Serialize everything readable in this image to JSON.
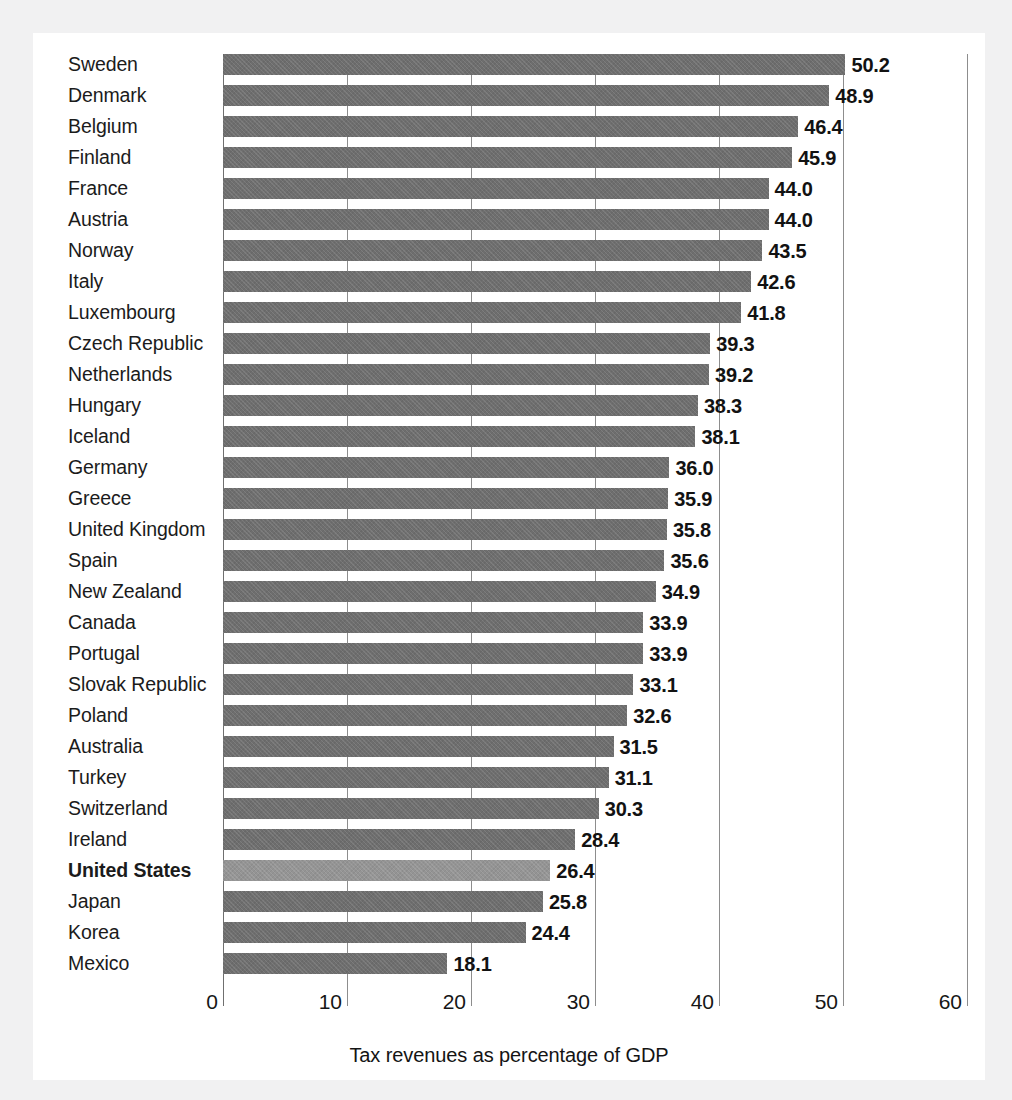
{
  "scan": {
    "top_partial_text": "",
    "page_background": "#f1f1f2",
    "panel_background": "#ffffff"
  },
  "colors": {
    "bar": "#6e6e6e",
    "bar_highlight": "#949494",
    "gridline": "#8d8d8d",
    "text": "#161616"
  },
  "chart_data": {
    "type": "bar",
    "orientation": "horizontal",
    "title": "",
    "xlabel": "Tax revenues as percentage of GDP",
    "ylabel": "",
    "xlim": [
      0,
      60
    ],
    "xticks": [
      0,
      10,
      20,
      30,
      40,
      50,
      60
    ],
    "xtick_labels": [
      "0",
      "10",
      "20",
      "30",
      "40",
      "50",
      "60"
    ],
    "grid": true,
    "grid_axis": "x",
    "legend": "none",
    "highlight_category": "United States",
    "value_labels": true,
    "value_label_format": "one-decimal",
    "categories": [
      "Sweden",
      "Denmark",
      "Belgium",
      "Finland",
      "France",
      "Austria",
      "Norway",
      "Italy",
      "Luxembourg",
      "Czech Republic",
      "Netherlands",
      "Hungary",
      "Iceland",
      "Germany",
      "Greece",
      "United Kingdom",
      "Spain",
      "New Zealand",
      "Canada",
      "Portugal",
      "Slovak Republic",
      "Poland",
      "Australia",
      "Turkey",
      "Switzerland",
      "Ireland",
      "United States",
      "Japan",
      "Korea",
      "Mexico"
    ],
    "values": [
      50.2,
      48.9,
      46.4,
      45.9,
      44.0,
      44.0,
      43.5,
      42.6,
      41.8,
      39.3,
      39.2,
      38.3,
      38.1,
      36.0,
      35.9,
      35.8,
      35.6,
      34.9,
      33.9,
      33.9,
      33.1,
      32.6,
      31.5,
      31.1,
      30.3,
      28.4,
      26.4,
      25.8,
      24.4,
      18.1
    ],
    "value_strings": [
      "50.2",
      "48.9",
      "46.4",
      "45.9",
      "44.0",
      "44.0",
      "43.5",
      "42.6",
      "41.8",
      "39.3",
      "39.2",
      "38.3",
      "38.1",
      "36.0",
      "35.9",
      "35.8",
      "35.6",
      "34.9",
      "33.9",
      "33.9",
      "33.1",
      "32.6",
      "31.5",
      "31.1",
      "30.3",
      "28.4",
      "26.4",
      "25.8",
      "24.4",
      "18.1"
    ]
  }
}
